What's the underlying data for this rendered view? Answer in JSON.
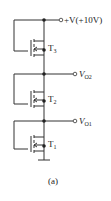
{
  "diagram": {
    "supply_label": "+V(+10V)",
    "outputs": [
      {
        "label": "V",
        "sub": "O2"
      },
      {
        "label": "V",
        "sub": "O1"
      }
    ],
    "transistors": [
      {
        "label": "T",
        "sub": "3"
      },
      {
        "label": "T",
        "sub": "2"
      },
      {
        "label": "T",
        "sub": "1"
      }
    ],
    "caption": "(a)",
    "colors": {
      "line": "#333333",
      "background": "#ffffff"
    }
  }
}
